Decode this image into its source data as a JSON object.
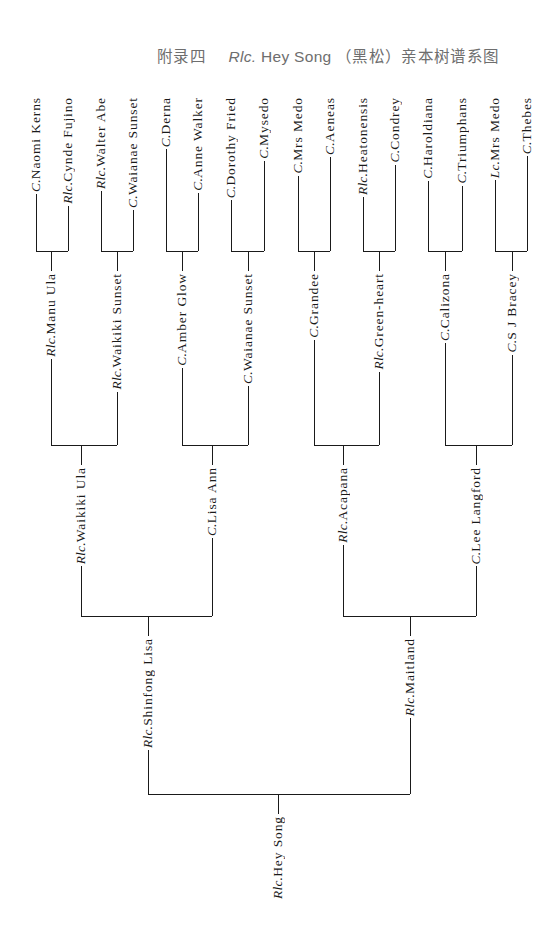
{
  "header": {
    "appendix": "附录四",
    "prefix": "Rlc.",
    "name": "Hey Song",
    "suffix": "（黑松）亲本树谱系图"
  },
  "tree": {
    "root": {
      "genus": "Rlc.",
      "name": "Hey Song"
    },
    "level4": [
      {
        "genus": "Rlc.",
        "name": "Shinfong Lisa"
      },
      {
        "genus": "Rlc.",
        "name": "Maitland"
      }
    ],
    "level3": [
      {
        "genus": "Rlc.",
        "name": "Waikiki Ula"
      },
      {
        "genus": "C.",
        "name": "Lisa Ann"
      },
      {
        "genus": "Rlc.",
        "name": "Acapana"
      },
      {
        "genus": "C.",
        "name": "Lee Langford"
      }
    ],
    "level2": [
      {
        "genus": "Rlc.",
        "name": "Manu Ula"
      },
      {
        "genus": "Rlc.",
        "name": "Waikiki Sunset"
      },
      {
        "genus": "C.",
        "name": "Amber Glow"
      },
      {
        "genus": "C.",
        "name": "Waianae Sunset"
      },
      {
        "genus": "C.",
        "name": "Grandee"
      },
      {
        "genus": "Rlc.",
        "name": "Green-heart"
      },
      {
        "genus": "C.",
        "name": "Calizona"
      },
      {
        "genus": "C.",
        "name": "S J Bracey"
      }
    ],
    "leaves": [
      {
        "genus": "C.",
        "name": "Naomi Kerns"
      },
      {
        "genus": "Rlc.",
        "name": "Cynde Fujino"
      },
      {
        "genus": "Rlc.",
        "name": "Walter Abe"
      },
      {
        "genus": "C.",
        "name": "Waianae Sunset"
      },
      {
        "genus": "C.",
        "name": "Derna"
      },
      {
        "genus": "C.",
        "name": "Anne Walker"
      },
      {
        "genus": "C.",
        "name": "Dorothy Fried"
      },
      {
        "genus": "C.",
        "name": "Mysedo"
      },
      {
        "genus": "C.",
        "name": "Mrs Medo"
      },
      {
        "genus": "C.",
        "name": "Aeneas"
      },
      {
        "genus": "Rlc.",
        "name": "Heatonensis"
      },
      {
        "genus": "C.",
        "name": "Condrey"
      },
      {
        "genus": "C.",
        "name": "Haroldiana"
      },
      {
        "genus": "C.",
        "name": "Triumphans"
      },
      {
        "genus": "Lc.",
        "name": "Mrs Medo"
      },
      {
        "genus": "C.",
        "name": "Thebes"
      }
    ]
  }
}
